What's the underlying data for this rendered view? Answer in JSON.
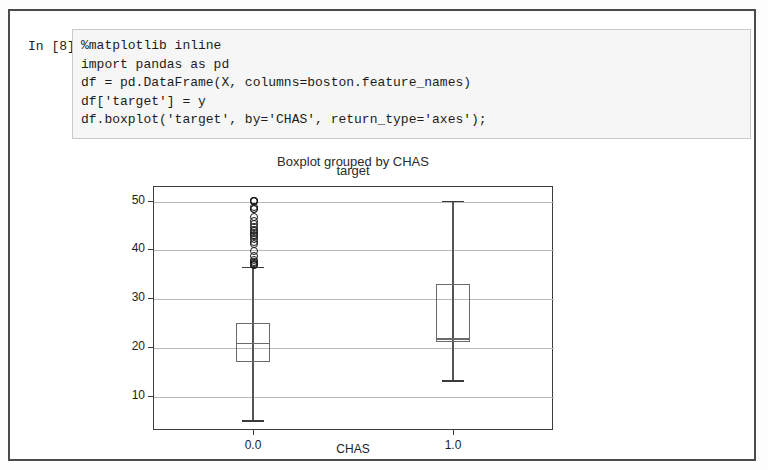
{
  "notebook": {
    "prompt_label": "In [8]:",
    "code_lines": [
      "%matplotlib inline",
      "import pandas as pd",
      "df = pd.DataFrame(X, columns=boston.feature_names)",
      "df['target'] = y",
      "df.boxplot('target', by='CHAS', return_type='axes');"
    ]
  },
  "chart_data": {
    "type": "box",
    "title": "Boxplot grouped by CHAS",
    "subtitle": "target",
    "xlabel": "CHAS",
    "ylabel": "",
    "categories": [
      "0.0",
      "1.0"
    ],
    "xtick_labels": [
      "0.0",
      "1.0"
    ],
    "ytick_labels": [
      "10",
      "20",
      "30",
      "40",
      "50"
    ],
    "ytick_values": [
      10,
      20,
      30,
      40,
      50
    ],
    "ylim": [
      3.0,
      53.0
    ],
    "grid": true,
    "legend": "none",
    "boxes": [
      {
        "name": "CHAS = 0.0",
        "whisker_low": 5.0,
        "q1": 17.0,
        "median": 20.9,
        "q3": 25.0,
        "whisker_high": 36.5,
        "outliers": [
          36.9,
          37.0,
          37.2,
          37.3,
          37.6,
          37.9,
          38.7,
          39.8,
          41.3,
          41.7,
          42.3,
          42.8,
          43.1,
          43.5,
          43.8,
          44.0,
          44.8,
          45.4,
          46.0,
          46.7,
          48.3,
          48.5,
          48.8,
          50.0,
          50.0,
          50.0,
          50.0
        ]
      },
      {
        "name": "CHAS = 1.0",
        "whisker_low": 13.2,
        "q1": 21.0,
        "median": 21.8,
        "q3": 33.0,
        "whisker_high": 50.0,
        "outliers": []
      }
    ]
  }
}
